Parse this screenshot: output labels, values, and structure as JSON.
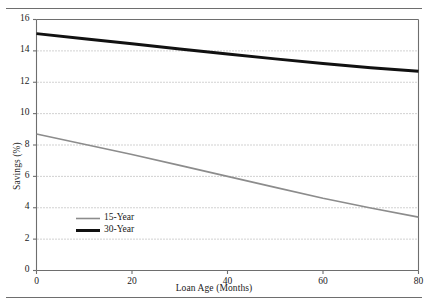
{
  "chart_data": {
    "type": "line",
    "title": "",
    "xlabel": "Loan Age (Months)",
    "ylabel": "Savings (%)",
    "xlim": [
      0,
      80
    ],
    "ylim": [
      0,
      16
    ],
    "xticks": [
      0,
      20,
      40,
      60,
      80
    ],
    "yticks": [
      0,
      2,
      4,
      6,
      8,
      10,
      12,
      14,
      16
    ],
    "xtick_labels": [
      "0",
      "20",
      "40",
      "60",
      "80"
    ],
    "ytick_labels": [
      "0",
      "2",
      "4",
      "6",
      "8",
      "10",
      "12",
      "14",
      "16"
    ],
    "grid": "horizontal-dotted",
    "legend_position": "lower-left-inside",
    "x": [
      0,
      10,
      20,
      30,
      40,
      50,
      60,
      70,
      80
    ],
    "series": [
      {
        "name": "15-Year",
        "color": "#8c8c8c",
        "line_width": 1.6,
        "values": [
          8.7,
          8.05,
          7.4,
          6.7,
          6.0,
          5.3,
          4.6,
          3.98,
          3.4
        ]
      },
      {
        "name": "30-Year",
        "color": "#111111",
        "line_width": 3.0,
        "values": [
          15.1,
          14.78,
          14.45,
          14.12,
          13.8,
          13.49,
          13.2,
          12.93,
          12.7
        ]
      }
    ]
  },
  "legend": {
    "entries": [
      {
        "label": "15-Year"
      },
      {
        "label": "30-Year"
      }
    ]
  },
  "axes": {
    "x_axis_label": "Loan Age (Months)",
    "y_axis_label": "Savings (%)"
  },
  "colors": {
    "series_15_year": "#8c8c8c",
    "series_30_year": "#111111",
    "frame": "#6e6e6e",
    "gridline": "#9a9a9a",
    "background": "#ffffff"
  }
}
